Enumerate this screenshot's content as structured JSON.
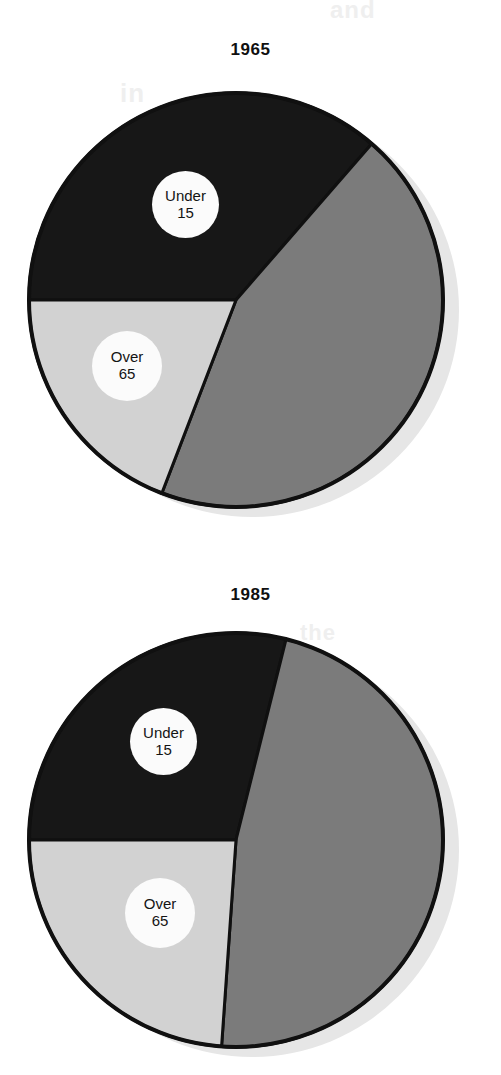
{
  "page": {
    "background_color": "#ffffff",
    "ghost_text": [
      "and",
      "in",
      "the"
    ]
  },
  "palette": {
    "under15_color": "#171717",
    "middle_color": "#7b7b7b",
    "over65_color": "#d2d2d2",
    "outline_color": "#101010",
    "shadow_color": "#e6e6e6",
    "bubble_color": "#fbfbfb",
    "text_color": "#111111"
  },
  "charts": [
    {
      "id": "pie-1965",
      "title": "1965",
      "chart_data": {
        "type": "pie",
        "title": "1965",
        "labels": [
          "Under 15",
          "15-64",
          "Over 65"
        ],
        "values": [
          36,
          45,
          19
        ],
        "unit": "percent",
        "start_angle_deg": 270,
        "direction": "clockwise",
        "slices": [
          {
            "label": "Under 15",
            "label_line1": "Under",
            "label_line2": "15",
            "value": 36,
            "start_deg": 270,
            "end_deg": 401,
            "color": "#171717",
            "labeled": true
          },
          {
            "label": "15-64",
            "label_line1": "",
            "label_line2": "",
            "value": 45,
            "start_deg": 41,
            "end_deg": 201,
            "color": "#7b7b7b",
            "labeled": false
          },
          {
            "label": "Over 65",
            "label_line1": "Over",
            "label_line2": "65",
            "value": 19,
            "start_deg": 201,
            "end_deg": 270,
            "color": "#d2d2d2",
            "labeled": true
          }
        ],
        "legend": "none",
        "grid": false
      }
    },
    {
      "id": "pie-1985",
      "title": "1985",
      "chart_data": {
        "type": "pie",
        "title": "1985",
        "labels": [
          "Under 15",
          "15-64",
          "Over 65"
        ],
        "values": [
          29,
          47,
          24
        ],
        "unit": "percent",
        "start_angle_deg": 270,
        "direction": "clockwise",
        "slices": [
          {
            "label": "Under 15",
            "label_line1": "Under",
            "label_line2": "15",
            "value": 29,
            "start_deg": 270,
            "end_deg": 374,
            "color": "#171717",
            "labeled": true
          },
          {
            "label": "15-64",
            "label_line1": "",
            "label_line2": "",
            "value": 47,
            "start_deg": 14,
            "end_deg": 184,
            "color": "#7b7b7b",
            "labeled": false
          },
          {
            "label": "Over 65",
            "label_line1": "Over",
            "label_line2": "65",
            "value": 24,
            "start_deg": 184,
            "end_deg": 270,
            "color": "#d2d2d2",
            "labeled": true
          }
        ],
        "legend": "none",
        "grid": false
      }
    }
  ]
}
